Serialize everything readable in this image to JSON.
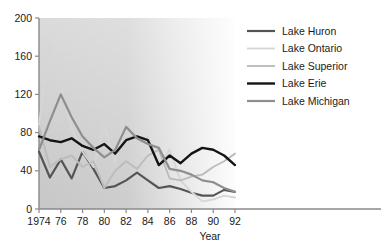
{
  "chart_data": {
    "type": "line",
    "title": "",
    "xlabel": "Year",
    "ylabel": "",
    "xlim": [
      1974,
      1992
    ],
    "ylim": [
      0,
      200
    ],
    "grid": false,
    "legend_position": "top-right",
    "x": [
      1974,
      1975,
      1976,
      1977,
      1978,
      1979,
      1980,
      1981,
      1982,
      1983,
      1984,
      1985,
      1986,
      1987,
      1988,
      1989,
      1990,
      1991,
      1992
    ],
    "x_tick_labels": [
      "1974",
      "76",
      "78",
      "80",
      "82",
      "84",
      "86",
      "88",
      "90",
      "92"
    ],
    "x_tick_values": [
      1974,
      1976,
      1978,
      1980,
      1982,
      1984,
      1986,
      1988,
      1990,
      1992
    ],
    "y_tick_labels": [
      "0",
      "40",
      "80",
      "120",
      "160",
      "200"
    ],
    "y_tick_values": [
      0,
      40,
      80,
      120,
      160,
      200
    ],
    "series": [
      {
        "name": "Lake Huron",
        "color": "#555555",
        "width": 2.2,
        "values": [
          60,
          33,
          52,
          32,
          60,
          42,
          22,
          24,
          30,
          38,
          30,
          22,
          24,
          21,
          17,
          14,
          14,
          20,
          18
        ]
      },
      {
        "name": "Lake Ontario",
        "color": "#d6d6d6",
        "width": 1.9,
        "values": [
          88,
          175,
          130,
          84,
          60,
          44,
          88,
          48,
          110,
          70,
          76,
          45,
          62,
          30,
          18,
          8,
          10,
          14,
          12
        ]
      },
      {
        "name": "Lake Superior",
        "color": "#bcbcbc",
        "width": 1.9,
        "values": [
          86,
          44,
          52,
          56,
          44,
          50,
          22,
          40,
          50,
          42,
          56,
          62,
          32,
          30,
          34,
          36,
          44,
          50,
          58
        ]
      },
      {
        "name": "Lake Erie",
        "color": "#141414",
        "width": 2.4,
        "values": [
          76,
          72,
          70,
          74,
          66,
          62,
          68,
          58,
          72,
          76,
          72,
          46,
          56,
          48,
          58,
          64,
          62,
          56,
          46
        ]
      },
      {
        "name": "Lake Michigan",
        "color": "#8e8e8e",
        "width": 2.2,
        "values": [
          62,
          92,
          120,
          96,
          76,
          64,
          54,
          62,
          86,
          74,
          68,
          64,
          42,
          40,
          36,
          30,
          28,
          22,
          18
        ]
      }
    ]
  },
  "plot_panel": {
    "background_from": "#c9c9c9",
    "background_to": "#ffffff"
  }
}
